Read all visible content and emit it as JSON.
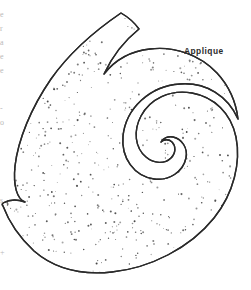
{
  "page": {
    "width": 251,
    "height": 290,
    "background_color": "#ffffff",
    "kind": "line-art pattern template"
  },
  "labels": {
    "applique": "Applique"
  },
  "margin_fragments": [
    {
      "text": "e",
      "top": 10
    },
    {
      "text": "r",
      "top": 24
    },
    {
      "text": "a",
      "top": 38
    },
    {
      "text": "e",
      "top": 52
    },
    {
      "text": "e",
      "top": 66
    },
    {
      "text": "-",
      "top": 104
    },
    {
      "text": "o",
      "top": 118
    },
    {
      "text": "s",
      "top": 196
    },
    {
      "text": "+",
      "top": 248
    }
  ],
  "figure": {
    "name": "paisley-applique-shape",
    "outline_color": "#2a2a2a",
    "outline_width": 1.4,
    "fill_color": "#ffffff",
    "stipple_color": "#444444",
    "stipple_count": 820,
    "outline_path": "M 121 13 C 96 30 70 52 51 79 C 31 108 18 140 15 166 C 13 186 17 199 25 202 C 17 199 10 199 3 203 C 2 204 2 205 3 206 C 9 222 20 238 34 251 C 56 270 84 275 112 272 C 150 268 190 248 214 218 C 234 193 241 162 236 137 C 231 113 214 97 192 93 C 170 89 150 99 141 116 C 133 131 135 148 146 157 C 154 164 165 164 171 158 C 176 153 176 146 172 142 C 169 139 164 139 161 142 C 163 138 168 136 173 137 C 182 139 188 148 186 158 C 183 172 169 181 154 179 C 134 176 121 158 123 136 C 126 108 150 86 180 84 C 206 82 228 96 238 119 C 236 102 229 86 217 73 C 200 55 175 46 150 49 C 131 51 115 60 104 74 C 112 57 124 41 139 29 C 134 22 128 17 121 13 Z",
    "inner_curl_path": "M 25 202 C 45 200 63 192 78 179 C 96 163 110 142 120 118 C 132 90 152 69 177 61"
  }
}
